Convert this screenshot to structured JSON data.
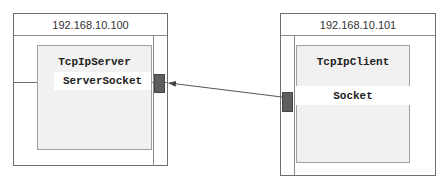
{
  "server_host": {
    "ip": "192.168.10.100",
    "app": {
      "name": "TcpIpServer",
      "socket": "ServerSocket"
    }
  },
  "client_host": {
    "ip": "192.168.10.101",
    "app": {
      "name": "TcpIpClient",
      "socket": "Socket"
    }
  },
  "connection": {
    "from": "client_host",
    "to": "server_host",
    "direction": "client-to-server"
  },
  "colors": {
    "border": "#6e6e6e",
    "panel": "#f1f1f1",
    "port": "#5e5e5e",
    "arrow": "#444444"
  }
}
